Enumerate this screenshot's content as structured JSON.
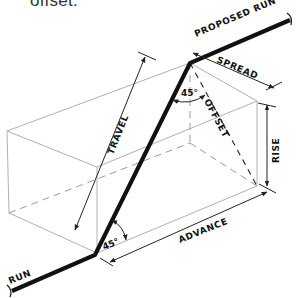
{
  "caption": "offset.",
  "diagram": {
    "labels": {
      "proposed_run": "PROPOSED RUN",
      "spread": "SPREAD",
      "offset": "OFFSET",
      "rise": "RISE",
      "travel": "TRAVEL",
      "advance": "ADVANCE",
      "run": "RUN",
      "angle_top": "45°",
      "angle_bottom": "45°"
    },
    "colors": {
      "pipe": "#111111",
      "box": "#b0b0b0",
      "dimension": "#222222",
      "background": "#ffffff"
    }
  }
}
